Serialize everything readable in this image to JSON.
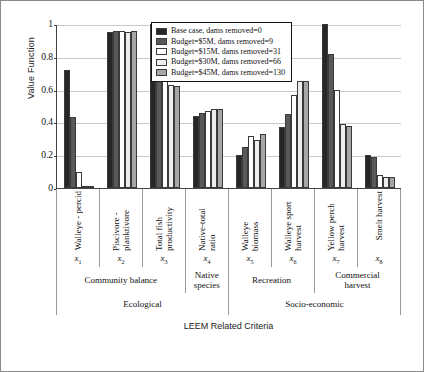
{
  "chart_data": {
    "type": "bar",
    "title": "",
    "xlabel": "LEEM Related Criteria",
    "ylabel": "Value Function",
    "ylim": [
      0,
      1
    ],
    "yticks": [
      "0",
      "0.2",
      "0.4",
      "0.6",
      "0.8",
      "1"
    ],
    "grid": true,
    "legend_position": "top-center",
    "categories": [
      "Walleye - percid",
      "Piscivore - planktivore",
      "Total fish productivity",
      "Native-total ratio",
      "Walleye biomass",
      "Walleye sport harvest",
      "Yellow perch harvest",
      "Smelt harvest"
    ],
    "category_symbols": [
      "x1",
      "x2",
      "x3",
      "x4",
      "x5",
      "x6",
      "x7",
      "x8"
    ],
    "series": [
      {
        "name": "Base case, dams removed=0",
        "color": "#262626",
        "values": [
          0.72,
          0.95,
          1.0,
          0.44,
          0.2,
          0.37,
          1.0,
          0.2
        ]
      },
      {
        "name": "Budget=$5M, dams removed=9",
        "color": "#595959",
        "values": [
          0.43,
          0.96,
          0.92,
          0.46,
          0.25,
          0.45,
          0.82,
          0.19
        ]
      },
      {
        "name": "Budget=$15M, dams removed=31",
        "color": "#ffffff",
        "values": [
          0.1,
          0.96,
          0.76,
          0.47,
          0.32,
          0.57,
          0.6,
          0.08
        ]
      },
      {
        "name": "Budget=$30M, dams removed=66",
        "color": "#ededed",
        "values": [
          0.01,
          0.95,
          0.63,
          0.48,
          0.29,
          0.65,
          0.39,
          0.07
        ]
      },
      {
        "name": "Budget=$45M, dams removed=130",
        "color": "#a6a6a6",
        "values": [
          0.01,
          0.96,
          0.62,
          0.48,
          0.33,
          0.65,
          0.38,
          0.07
        ]
      }
    ],
    "mid_groups": [
      {
        "label": "Community balance",
        "span": 3
      },
      {
        "label": "Native\nspecies",
        "span": 1
      },
      {
        "label": "Recreation",
        "span": 2
      },
      {
        "label": "Commercial\nharvest",
        "span": 2
      }
    ],
    "top_groups": [
      {
        "label": "Ecological",
        "span": 4
      },
      {
        "label": "Socio-economic",
        "span": 4
      }
    ]
  }
}
